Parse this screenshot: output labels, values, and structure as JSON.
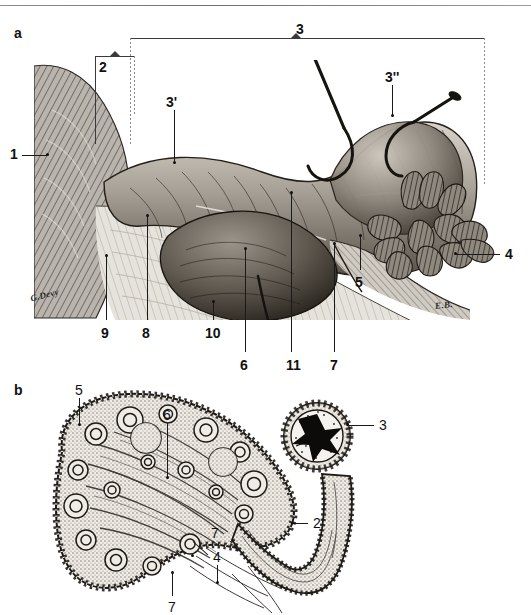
{
  "figure": {
    "background_color": "#ffffff",
    "ink_color": "#111111",
    "panels": [
      {
        "id": "a",
        "letter": "a",
        "caption_type": "gross-dissection"
      },
      {
        "id": "b",
        "letter": "b",
        "caption_type": "histological-section"
      }
    ]
  },
  "panel_a": {
    "letter": "a",
    "signatures": [
      {
        "text": "G.Devy",
        "x": 30,
        "y": 290
      },
      {
        "text": "E.B.",
        "x": 435,
        "y": 300
      }
    ],
    "brackets": [
      {
        "name": "bracket-2",
        "label": "2",
        "x": 95,
        "y": 56,
        "width": 40,
        "arm_left_height": 88,
        "arm_right_height": 58
      },
      {
        "name": "bracket-3",
        "label": "3",
        "x": 130,
        "y": 38,
        "width": 355,
        "arm_left_height": 106,
        "arm_right_height": 148
      }
    ],
    "labels": [
      {
        "id": "a-1",
        "text": "1",
        "x": 10,
        "y": 147,
        "bold": true,
        "leader": {
          "type": "h",
          "x1": 22,
          "y1": 155,
          "x2": 48,
          "y2": 155,
          "dot": "end"
        }
      },
      {
        "id": "a-2",
        "text": "2",
        "x": 99,
        "y": 60,
        "bold": true,
        "leader": null
      },
      {
        "id": "a-3",
        "text": "3",
        "x": 296,
        "y": 22,
        "bold": true,
        "leader": null
      },
      {
        "id": "a-3p",
        "text": "3'",
        "x": 166,
        "y": 95,
        "bold": true,
        "leader": {
          "type": "v",
          "x1": 174,
          "y1": 110,
          "x2": 174,
          "y2": 163,
          "dot": "end"
        }
      },
      {
        "id": "a-3pp",
        "text": "3''",
        "x": 385,
        "y": 70,
        "bold": true,
        "leader": {
          "type": "v",
          "x1": 392,
          "y1": 85,
          "x2": 392,
          "y2": 116,
          "dot": "end"
        }
      },
      {
        "id": "a-4",
        "text": "4",
        "x": 505,
        "y": 247,
        "bold": true,
        "leader": {
          "type": "h",
          "x1": 455,
          "y1": 254,
          "x2": 500,
          "y2": 254,
          "dot": "start"
        }
      },
      {
        "id": "a-5",
        "text": "5",
        "x": 355,
        "y": 275,
        "bold": true,
        "leader": {
          "type": "v",
          "x1": 360,
          "y1": 235,
          "x2": 360,
          "y2": 270,
          "dot": "start"
        }
      },
      {
        "id": "a-6",
        "text": "6",
        "x": 240,
        "y": 358,
        "bold": true,
        "leader": {
          "type": "v",
          "x1": 245,
          "y1": 249,
          "x2": 245,
          "y2": 352,
          "dot": "start"
        }
      },
      {
        "id": "a-7",
        "text": "7",
        "x": 330,
        "y": 358,
        "bold": true,
        "leader": {
          "type": "v",
          "x1": 334,
          "y1": 244,
          "x2": 334,
          "y2": 352,
          "dot": "start"
        }
      },
      {
        "id": "a-8",
        "text": "8",
        "x": 142,
        "y": 326,
        "bold": true,
        "leader": {
          "type": "v",
          "x1": 147,
          "y1": 216,
          "x2": 147,
          "y2": 320,
          "dot": "start"
        }
      },
      {
        "id": "a-9",
        "text": "9",
        "x": 101,
        "y": 326,
        "bold": true,
        "leader": {
          "type": "v",
          "x1": 106,
          "y1": 256,
          "x2": 106,
          "y2": 320,
          "dot": "start"
        }
      },
      {
        "id": "a-10",
        "text": "10",
        "x": 205,
        "y": 326,
        "bold": true,
        "leader": {
          "type": "v",
          "x1": 213,
          "y1": 302,
          "x2": 213,
          "y2": 320,
          "dot": "start"
        }
      },
      {
        "id": "a-11",
        "text": "11",
        "x": 286,
        "y": 358,
        "bold": true,
        "leader": {
          "type": "v",
          "x1": 291,
          "y1": 193,
          "x2": 291,
          "y2": 352,
          "dot": "start"
        }
      }
    ],
    "pins": [
      {
        "name": "pin-upper",
        "head_x": 312,
        "head_y": 48
      },
      {
        "name": "pin-lower",
        "head_x": 455,
        "head_y": 95
      }
    ]
  },
  "panel_b": {
    "letter": "b",
    "labels": [
      {
        "id": "b-5",
        "text": "5",
        "x": 75,
        "y": 383,
        "leader": {
          "type": "v",
          "x1": 79,
          "y1": 398,
          "x2": 79,
          "y2": 425,
          "dot": "end"
        }
      },
      {
        "id": "b-6",
        "text": "6",
        "x": 163,
        "y": 408,
        "leader": {
          "type": "v",
          "x1": 167,
          "y1": 423,
          "x2": 167,
          "y2": 478,
          "dot": "end"
        }
      },
      {
        "id": "b-3",
        "text": "3",
        "x": 379,
        "y": 418,
        "leader": {
          "type": "h",
          "x1": 347,
          "y1": 425,
          "x2": 374,
          "y2": 425,
          "dot": "start"
        }
      },
      {
        "id": "b-2",
        "text": "2",
        "x": 313,
        "y": 516,
        "leader": {
          "type": "h",
          "x1": 292,
          "y1": 523,
          "x2": 308,
          "y2": 523,
          "dot": "start"
        }
      },
      {
        "id": "b-7a",
        "text": "7",
        "x": 211,
        "y": 526,
        "leader": {
          "type": "d",
          "x1": 208,
          "y1": 541,
          "x2": 193,
          "y2": 555,
          "dot": "end"
        }
      },
      {
        "id": "b-4",
        "text": "4",
        "x": 213,
        "y": 550,
        "leader": {
          "type": "v",
          "x1": 217,
          "y1": 565,
          "x2": 217,
          "y2": 583,
          "dot": "end"
        }
      },
      {
        "id": "b-7b",
        "text": "7",
        "x": 168,
        "y": 600,
        "leader": {
          "type": "v",
          "x1": 172,
          "y1": 573,
          "x2": 172,
          "y2": 596,
          "dot": "start"
        }
      }
    ]
  }
}
